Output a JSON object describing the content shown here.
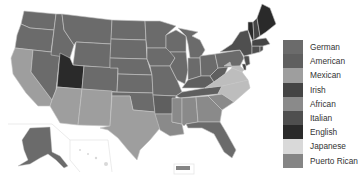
{
  "map": {
    "type": "choropleth",
    "region": "United States",
    "insets": [
      "Alaska",
      "Hawaii",
      "Puerto Rico"
    ],
    "border_color": "#b8b8b8"
  },
  "legend": {
    "items": [
      {
        "label": "German",
        "color": "#6b6b6b"
      },
      {
        "label": "American",
        "color": "#5f5f5f"
      },
      {
        "label": "Mexican",
        "color": "#9e9e9e"
      },
      {
        "label": "Irish",
        "color": "#444444"
      },
      {
        "label": "African",
        "color": "#8a8a8a"
      },
      {
        "label": "Italian",
        "color": "#4f4f4f"
      },
      {
        "label": "English",
        "color": "#2a2a2a"
      },
      {
        "label": "Japanese",
        "color": "#d9d9d9"
      },
      {
        "label": "Puerto Rican",
        "color": "#858585"
      }
    ]
  },
  "states": {
    "German": [
      "WA",
      "OR",
      "ID",
      "MT",
      "WY",
      "ND",
      "SD",
      "NE",
      "KS",
      "MN",
      "IA",
      "WI",
      "MI",
      "IL",
      "IN",
      "OH",
      "PA",
      "MO",
      "CO",
      "AK"
    ],
    "American": [
      "AR",
      "KY",
      "TN",
      "WV"
    ],
    "Mexican": [
      "CA",
      "AZ",
      "NM",
      "TX"
    ],
    "Irish": [
      "MA",
      "NH",
      "DE"
    ],
    "African": [
      "MS",
      "AL",
      "GA",
      "SC",
      "LA"
    ],
    "Italian": [
      "NY",
      "NJ",
      "CT",
      "RI"
    ],
    "English": [
      "UT",
      "ME",
      "VT"
    ],
    "Japanese": [
      "HI"
    ],
    "Puerto Rican": [
      "PR"
    ],
    "Other_light": [
      "NC",
      "VA",
      "MD"
    ]
  }
}
